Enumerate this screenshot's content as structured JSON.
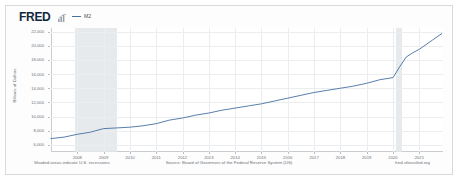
{
  "header": {
    "logo_text": "FRED",
    "logo_icon": "bar-chart-icon",
    "legend": [
      {
        "label": "M2",
        "color": "#4471a3"
      }
    ]
  },
  "footer": {
    "left_note": "Shaded areas indicate U.S. recessions",
    "source": "Source: Board of Governors of the Federal Reserve System (US)",
    "site": "fred.stlouisfed.org"
  },
  "colors": {
    "series_line": "#4471a3",
    "recession_band": "#e3e6ea",
    "grid": "#ebedee",
    "axis": "#c9ccd0",
    "tick_text": "#6c7177",
    "card_bg": "#fdfdfd",
    "card_border": "#d7d9dc"
  },
  "chart_data": {
    "type": "line",
    "title": "",
    "xlabel": "",
    "ylabel": "Billions of Dollars",
    "xlim": [
      2007.0,
      2021.9
    ],
    "ylim": [
      5000,
      22500
    ],
    "grid": true,
    "legend_position": "top-left",
    "ytick_labels": [
      "22,000",
      "20,000",
      "18,000",
      "16,000",
      "14,000",
      "12,000",
      "10,000",
      "8,000",
      "6,000"
    ],
    "ytick_values": [
      22000,
      20000,
      18000,
      16000,
      14000,
      12000,
      10000,
      8000,
      6000
    ],
    "xtick_labels": [
      "2008",
      "2009",
      "2010",
      "2011",
      "2012",
      "2013",
      "2014",
      "2015",
      "2016",
      "2017",
      "2018",
      "2019",
      "2020",
      "2021"
    ],
    "xtick_values": [
      2008,
      2009,
      2010,
      2011,
      2012,
      2013,
      2014,
      2015,
      2016,
      2017,
      2018,
      2019,
      2020,
      2021
    ],
    "annotations": [
      {
        "type": "recession_band",
        "label": "2007-2009 recession",
        "start": 2007.92,
        "end": 2009.5
      },
      {
        "type": "recession_band",
        "label": "2020 recession",
        "start": 2020.1,
        "end": 2020.33
      }
    ],
    "series": [
      {
        "name": "M2",
        "color": "#4471a3",
        "x": [
          2007.0,
          2007.5,
          2008.0,
          2008.5,
          2009.0,
          2009.5,
          2010.0,
          2010.5,
          2011.0,
          2011.5,
          2012.0,
          2012.5,
          2013.0,
          2013.5,
          2014.0,
          2014.5,
          2015.0,
          2015.5,
          2016.0,
          2016.5,
          2017.0,
          2017.5,
          2018.0,
          2018.5,
          2019.0,
          2019.5,
          2020.0,
          2020.25,
          2020.5,
          2020.75,
          2021.0,
          2021.5,
          2021.85
        ],
        "values": [
          6900,
          7100,
          7500,
          7800,
          8300,
          8400,
          8500,
          8700,
          9000,
          9500,
          9800,
          10200,
          10500,
          10900,
          11200,
          11500,
          11800,
          12200,
          12600,
          13000,
          13400,
          13700,
          14000,
          14300,
          14700,
          15200,
          15500,
          17000,
          18400,
          19000,
          19500,
          20800,
          21700
        ]
      }
    ]
  }
}
